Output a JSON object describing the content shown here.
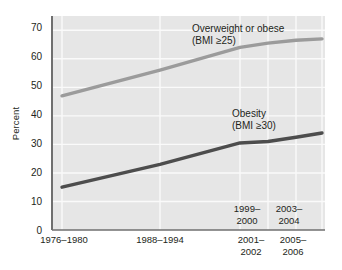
{
  "chart_data": {
    "type": "line",
    "title": "",
    "subtitle": "",
    "xlabel": "",
    "ylabel": "Percent",
    "ylim": [
      0,
      75
    ],
    "yticks": [
      0,
      10,
      20,
      30,
      40,
      50,
      60,
      70
    ],
    "grid": true,
    "legend_position": "inline-annotation",
    "categories": [
      "1976-1980",
      "1988-1994",
      "1999-2000",
      "2001-2002",
      "2003-2004",
      "2005-2006"
    ],
    "x_tick_labels_below_axis": [
      {
        "line1": "1976–1980",
        "line2": ""
      },
      {
        "line1": "1988–1994",
        "line2": ""
      },
      {
        "line1": "2001–",
        "line2": "2002"
      },
      {
        "line1": "2005–",
        "line2": "2006"
      }
    ],
    "x_tick_labels_inside_plot": [
      {
        "line1": "1999–",
        "line2": "2000"
      },
      {
        "line1": "2003–",
        "line2": "2004"
      }
    ],
    "series": [
      {
        "name": "Overweight or obese",
        "sublabel": "(BMI ≥25)",
        "color": "#9b9b9b",
        "values": [
          47,
          56,
          64,
          65.5,
          66.5,
          67
        ]
      },
      {
        "name": "Obesity",
        "sublabel": "(BMI ≥30)",
        "color": "#4d4d4d",
        "values": [
          15,
          23,
          30.5,
          31,
          32.5,
          34
        ]
      }
    ],
    "annotations": [
      {
        "text": "Overweight or obese",
        "sub": "(BMI ≥25)"
      },
      {
        "text": "Obesity",
        "sub": "(BMI ≥30)"
      }
    ],
    "colors": {
      "plot_background": "#e6e6e6",
      "gridline": "#fafafa",
      "axis": "#6f6f6f",
      "text": "#231f20",
      "overweight_line": "#9b9b9b",
      "obesity_line": "#4d4d4d"
    }
  },
  "axis": {
    "y_title": "Percent",
    "y_ticks": [
      "70",
      "60",
      "50",
      "40",
      "30",
      "20",
      "10",
      "0"
    ]
  },
  "labels": {
    "overweight_title": "Overweight or obese",
    "overweight_sub": "(BMI ≥25)",
    "obesity_title": "Obesity",
    "obesity_sub": "(BMI ≥30)",
    "x1_l1": "1976–1980",
    "x2_l1": "1988–1994",
    "x3_l1": "2001–",
    "x3_l2": "2002",
    "x4_l1": "2005–",
    "x4_l2": "2006",
    "in1_l1": "1999–",
    "in1_l2": "2000",
    "in2_l1": "2003–",
    "in2_l2": "2004"
  }
}
